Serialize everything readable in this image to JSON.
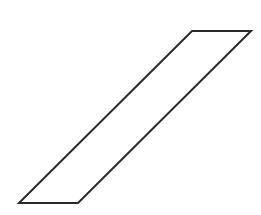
{
  "diagram": {
    "shape": "parallelogram",
    "background": "#ffffff",
    "stroke_color": "#2a2a2a",
    "stroke_width": 2,
    "fill": "none",
    "vertices": [
      {
        "x": 192,
        "y": 31
      },
      {
        "x": 251,
        "y": 31
      },
      {
        "x": 78,
        "y": 203
      },
      {
        "x": 19,
        "y": 203
      }
    ]
  }
}
